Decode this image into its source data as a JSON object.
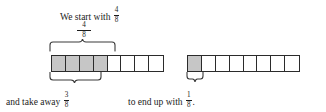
{
  "figure": {
    "type": "fraction-bar-model",
    "denominator": 8,
    "caption_top": {
      "lead_text": "We start with",
      "fraction": {
        "numerator": "4",
        "denominator": "8"
      }
    },
    "brace_top_label": {
      "numerator": "4",
      "denominator": "8"
    },
    "caption_bottom_left": {
      "lead_text": "and take away",
      "fraction": {
        "numerator": "3",
        "denominator": "8"
      },
      "trailing": ""
    },
    "caption_bottom_right": {
      "lead_text": "to end up with",
      "fraction": {
        "numerator": "1",
        "denominator": "8"
      },
      "trailing": "."
    },
    "bars": [
      {
        "name": "start-bar",
        "total_cells": 8,
        "shaded_cells": 4,
        "cells": [
          "shaded",
          "shaded",
          "shaded",
          "shaded",
          "empty",
          "empty",
          "empty",
          "empty"
        ]
      },
      {
        "name": "result-bar",
        "total_cells": 8,
        "shaded_cells": 1,
        "cells": [
          "shaded",
          "empty",
          "empty",
          "empty",
          "empty",
          "empty",
          "empty",
          "empty"
        ]
      }
    ],
    "braces": [
      {
        "name": "brace-top",
        "spans_cells": 4,
        "label": "4/8",
        "direction": "up"
      },
      {
        "name": "brace-bottom-left",
        "spans_cells": 3,
        "label": "3/8",
        "direction": "down"
      },
      {
        "name": "brace-bottom-right",
        "spans_cells": 1,
        "label": "1/8",
        "direction": "down"
      }
    ],
    "colors": {
      "shaded_fill": "#c6c6c6",
      "cell_stroke": "#2b2b2b",
      "text": "#1b1b1b",
      "background": "#ffffff"
    }
  }
}
